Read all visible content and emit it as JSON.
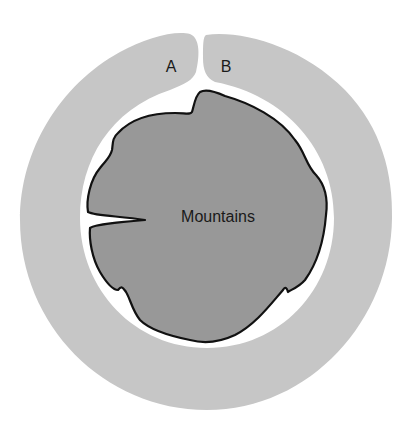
{
  "diagram": {
    "type": "island-rain-shadow",
    "center_label": "Mountains",
    "region_labels": [
      {
        "id": "A",
        "text": "A"
      },
      {
        "id": "B",
        "text": "B"
      }
    ],
    "colors": {
      "background": "#ffffff",
      "outer_ring": "#c6c6c6",
      "coast_gap": "#ffffff",
      "mountains_fill": "#989898",
      "mountains_outline": "#111111",
      "text": "#1a1a1a"
    }
  }
}
